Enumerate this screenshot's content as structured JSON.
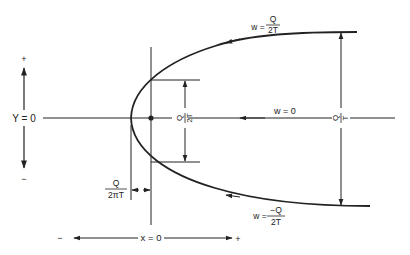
{
  "diagram": {
    "type": "flow-streamline-diagram",
    "colors": {
      "ink": "#222222",
      "background": "#ffffff"
    },
    "axes": {
      "y_axis": {
        "label": "Y = 0",
        "plus": "+",
        "minus": "−"
      },
      "x_axis": {
        "label": "x = 0",
        "plus": "+",
        "minus": "−"
      }
    },
    "streamlines": {
      "upper": {
        "w": "w =",
        "num": "Q",
        "den": "2T"
      },
      "center": {
        "label": "w = 0"
      },
      "lower": {
        "w": "w =",
        "num": "−Q",
        "den": "2T"
      }
    },
    "dimensions": {
      "half_width_at_origin": {
        "num": "Q",
        "den": "2T"
      },
      "full_width_far": {
        "num": "Q",
        "den": "T"
      },
      "stagnation_offset": {
        "num": "Q",
        "den": "2πT"
      }
    }
  }
}
